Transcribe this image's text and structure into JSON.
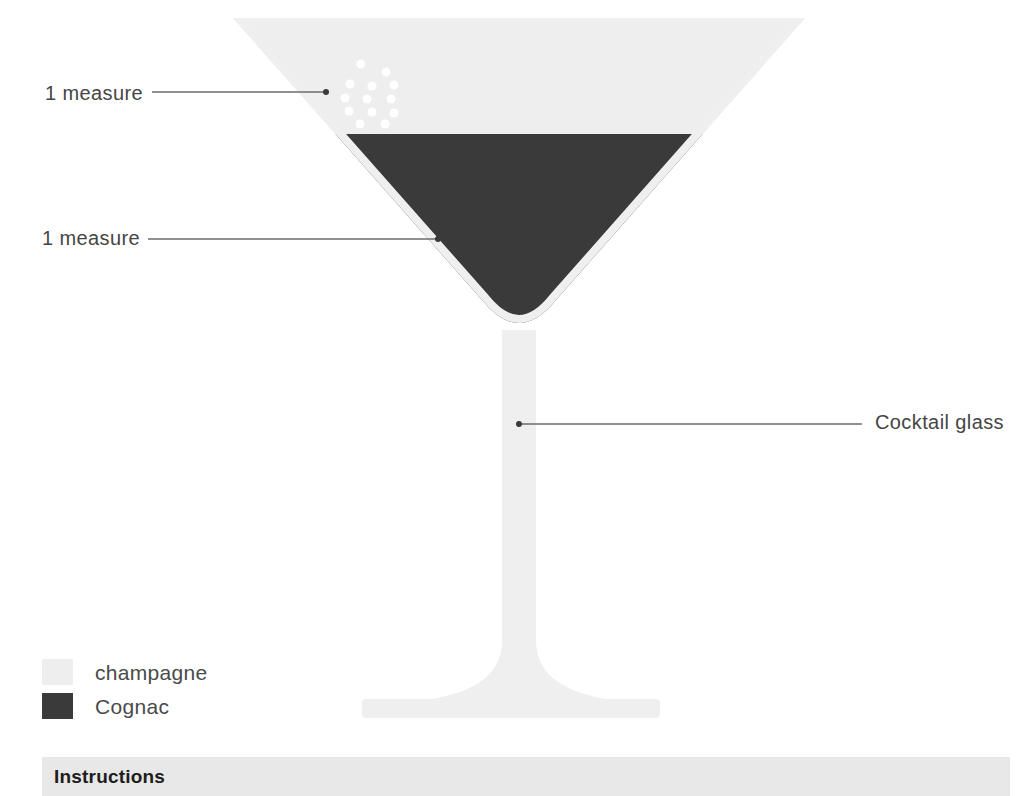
{
  "page": {
    "background_color": "#ffffff",
    "width": 1030,
    "height": 796
  },
  "colors": {
    "champagne": "#eeeeee",
    "cognac": "#3a3a3a",
    "glass": "#efefef",
    "bubble": "#ffffff",
    "leader_line": "#6b6b6b",
    "label_text": "#454545",
    "instructions_band": "#e8e8e8",
    "instructions_text": "#1d1d1d"
  },
  "callouts": [
    {
      "id": "champagne-measure",
      "label": "1 measure",
      "target": "champagne layer"
    },
    {
      "id": "cognac-measure",
      "label": "1 measure",
      "target": "cognac layer"
    },
    {
      "id": "glassware",
      "label": "Cocktail glass",
      "target": "glass stem"
    }
  ],
  "legend": {
    "items": [
      {
        "label": "champagne",
        "color": "#eeeeee"
      },
      {
        "label": "Cognac",
        "color": "#3a3a3a"
      }
    ]
  },
  "instructions": {
    "title": "Instructions"
  },
  "diagram": {
    "object": "cocktail-glass",
    "layers": [
      {
        "name": "champagne",
        "measures": 1,
        "color": "#eeeeee",
        "position": "top"
      },
      {
        "name": "Cognac",
        "measures": 1,
        "color": "#3a3a3a",
        "position": "bottom"
      }
    ],
    "bubbles_count": 13
  }
}
